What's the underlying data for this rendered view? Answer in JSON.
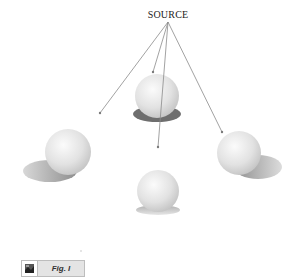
{
  "diagram": {
    "source_label": "SOURCE",
    "source_point": {
      "x": 168,
      "y": 22
    },
    "arrows": [
      {
        "name": "to-left-sphere",
        "x2": 100,
        "y2": 113
      },
      {
        "name": "to-top-sphere",
        "x2": 153,
        "y2": 72
      },
      {
        "name": "to-bottom-sphere",
        "x2": 158,
        "y2": 147
      },
      {
        "name": "to-right-sphere",
        "x2": 222,
        "y2": 132
      }
    ],
    "spheres": [
      {
        "name": "top",
        "cx": 157,
        "cy": 96,
        "r": 22
      },
      {
        "name": "left",
        "cx": 68,
        "cy": 152,
        "r": 23
      },
      {
        "name": "bottom",
        "cx": 158,
        "cy": 191,
        "r": 21
      },
      {
        "name": "right",
        "cx": 239,
        "cy": 153,
        "r": 22
      }
    ],
    "colors": {
      "line": "#8a8a8a",
      "sphere_light": "#f7f7f7",
      "sphere_dark": "#bdbdbd",
      "shadow": "#9a9a9a"
    }
  },
  "caption": {
    "icon": "figure-icon",
    "label": "Fig. I"
  }
}
